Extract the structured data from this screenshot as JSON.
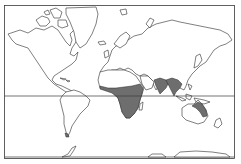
{
  "map": {
    "projection": "Mercator world outline",
    "colors": {
      "background": "#ffffff",
      "outline": "#2a2a2a",
      "range_fill": "#6e6e6e"
    },
    "reference_lines": [
      {
        "name": "equator",
        "y": 96
      },
      {
        "name": "southern-boundary",
        "y": 157
      }
    ],
    "shaded_regions": [
      {
        "name": "sub-saharan-africa"
      },
      {
        "name": "south-asia-india"
      },
      {
        "name": "southeast-asia-indochina"
      },
      {
        "name": "northeast-australia"
      },
      {
        "name": "tierra-del-fuego"
      }
    ]
  }
}
